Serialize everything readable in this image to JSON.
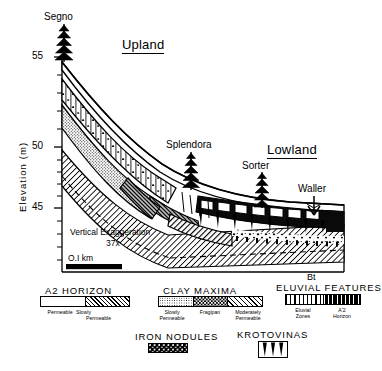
{
  "figure": {
    "type": "geologic-cross-section",
    "upland_label": "Upland",
    "lowland_label": "Lowland"
  },
  "axis": {
    "y_title": "Elevation (m)",
    "y_ticks_major": [
      "55",
      "50",
      "45"
    ],
    "y_major_values": [
      55,
      50,
      45
    ],
    "y_minor_count_between": 4,
    "y_range": [
      42,
      56
    ]
  },
  "sites": [
    {
      "name": "Segno",
      "symbol": "conifer-tree"
    },
    {
      "name": "Splendora",
      "symbol": "conifer-tree"
    },
    {
      "name": "Sorter",
      "symbol": "conifer-tree"
    },
    {
      "name": "Waller",
      "symbol": "shrub-arrow"
    }
  ],
  "annotations": {
    "vertical_exaggeration_line1": "Vertical Exaggeration",
    "vertical_exaggeration_line2": "37x",
    "scale_bar_label": "O.I km",
    "bt_label": "Bt"
  },
  "legend": {
    "groups": [
      {
        "title": "A2 HORIZON",
        "swatches": [
          {
            "pattern": "p-white",
            "label_line1": "Permeable",
            "label_line2": ""
          },
          {
            "pattern": "p-slowperm-leg",
            "label_line1": "Slowly",
            "label_line2": "Permeable"
          }
        ]
      },
      {
        "title": "CLAY MAXIMA",
        "swatches": [
          {
            "pattern": "p-slowperm",
            "label_line1": "Slowly",
            "label_line2": "Permeable"
          },
          {
            "pattern": "p-fragipan",
            "label_line1": "Fragipan",
            "label_line2": ""
          },
          {
            "pattern": "p-modperm",
            "label_line1": "Moderately",
            "label_line2": "Permeable"
          }
        ]
      },
      {
        "title": "ELUVIAL FEATURES",
        "swatches": [
          {
            "pattern": "p-eluvial",
            "label_line1": "Eluvial",
            "label_line2": "Zones"
          },
          {
            "pattern": "p-a2prime",
            "label_line1": "A'2",
            "label_line2": "Horizon"
          }
        ]
      },
      {
        "title": "IRON NODULES",
        "swatches": [
          {
            "pattern": "p-nodule",
            "label_line1": "",
            "label_line2": ""
          }
        ]
      },
      {
        "title": "KROTOVINAS",
        "swatches": [
          {
            "pattern": "krotovina",
            "label_line1": "",
            "label_line2": ""
          }
        ]
      }
    ]
  },
  "colors": {
    "ink": "#000000",
    "paper": "#ffffff"
  }
}
